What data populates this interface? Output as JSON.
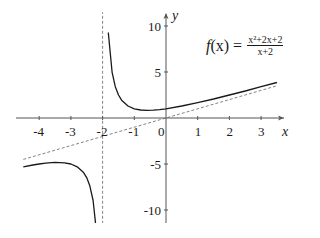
{
  "chart_data": {
    "type": "line",
    "title": "",
    "function": "f(x) = (x^2+2x+2)/(x+2)",
    "legend": {
      "lhs_f": "f",
      "lhs_x": "(x) =",
      "numerator": "x²+2x+2",
      "denominator": "x+2"
    },
    "xlabel": "x",
    "ylabel": "y",
    "xlim": [
      -4.6,
      3.8
    ],
    "ylim": [
      -11.5,
      11.5
    ],
    "x_ticks": [
      -4,
      -3,
      -2,
      -1,
      0,
      1,
      2,
      3
    ],
    "x_tick_labels": [
      "-4",
      "-3",
      "-2",
      "-1",
      "0",
      "1",
      "2",
      "3"
    ],
    "y_ticks": [
      -10,
      -5,
      5,
      10
    ],
    "y_tick_labels": [
      "-10",
      "-5",
      "5",
      "10"
    ],
    "grid": false,
    "series": [
      {
        "name": "f(x) right branch",
        "style": "solid",
        "x": [
          -1.82,
          -1.7,
          -1.6,
          -1.5,
          -1.4,
          -1.2,
          -1.0,
          -0.8,
          -0.6,
          -0.4,
          -0.2,
          0,
          0.5,
          1,
          1.5,
          2,
          2.5,
          3,
          3.5
        ],
        "y": [
          9.29,
          4.97,
          3.4,
          2.5,
          1.93,
          1.3,
          1.0,
          0.87,
          0.83,
          0.85,
          0.91,
          1.0,
          1.3,
          1.67,
          2.07,
          2.5,
          2.94,
          3.4,
          3.86
        ]
      },
      {
        "name": "f(x) left branch",
        "style": "solid",
        "x": [
          -4.5,
          -4.2,
          -4.0,
          -3.8,
          -3.5,
          -3.2,
          -3.0,
          -2.8,
          -2.6,
          -2.5,
          -2.4,
          -2.3,
          -2.2,
          -2.18
        ],
        "y": [
          -5.3,
          -5.11,
          -5.0,
          -4.91,
          -4.83,
          -4.87,
          -5.0,
          -5.3,
          -5.93,
          -6.5,
          -7.4,
          -8.97,
          -12.2,
          -13.29
        ]
      },
      {
        "name": "oblique asymptote y = x",
        "style": "dashed",
        "x": [
          -4.5,
          3.5
        ],
        "y": [
          -4.5,
          3.5
        ]
      },
      {
        "name": "vertical asymptote x = -2",
        "style": "dashed",
        "x": [
          -2,
          -2
        ],
        "y": [
          -11.5,
          11.5
        ]
      }
    ]
  },
  "colors": {
    "curve": "#1a1a1a",
    "axis": "#555555",
    "asymptote": "#666666"
  }
}
